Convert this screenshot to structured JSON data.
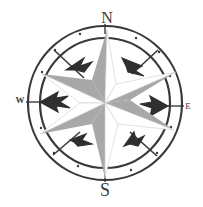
{
  "compass": {
    "center": [
      105,
      103
    ],
    "outer_ring_radius": 77,
    "inner_ring_radius": 65,
    "labels": {
      "north": "N",
      "south": "S",
      "east": "E",
      "west": "W"
    },
    "colors": {
      "background": "#ffffff",
      "ring": "#3a3a3a",
      "star_shaded": "#a8a8a8",
      "star_light": "#ffffff",
      "arrows": "#2f2f2f"
    }
  }
}
